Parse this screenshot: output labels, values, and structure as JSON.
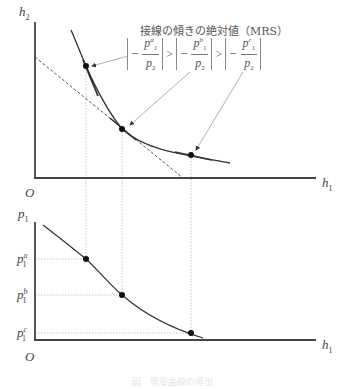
{
  "top_chart": {
    "y_axis_label": "h",
    "y_axis_sub": "2",
    "x_axis_label": "h",
    "x_axis_sub": "1",
    "origin_label": "O",
    "annotation_title": "接線の傾きの絶対値（MRS）",
    "mrs_terms": [
      {
        "minus": "−",
        "num": "p",
        "num_sub": "1",
        "num_sup": "a",
        "den": "p",
        "den_sub": "2"
      },
      {
        "minus": "−",
        "num": "p",
        "num_sub": "1",
        "num_sup": "b",
        "den": "p",
        "den_sub": "2"
      },
      {
        "minus": "−",
        "num": "p",
        "num_sub": "1",
        "num_sup": "c",
        "den": "p",
        "den_sub": "2"
      }
    ],
    "gt_symbol": ">",
    "points": [
      "a",
      "b",
      "c"
    ]
  },
  "bottom_chart": {
    "y_axis_label": "p",
    "y_axis_sub": "1",
    "x_axis_label": "h",
    "x_axis_sub": "1",
    "origin_label": "O",
    "price_labels": [
      {
        "base": "p",
        "sub": "1",
        "sup": "a"
      },
      {
        "base": "p",
        "sub": "1",
        "sup": "b"
      },
      {
        "base": "p",
        "sub": "1",
        "sup": "c"
      }
    ]
  },
  "caption": "図　需要曲線の導出",
  "colors": {
    "axis": "#444444",
    "curve": "#333333",
    "guide": "#bbbbbb",
    "arrow": "#999999"
  }
}
